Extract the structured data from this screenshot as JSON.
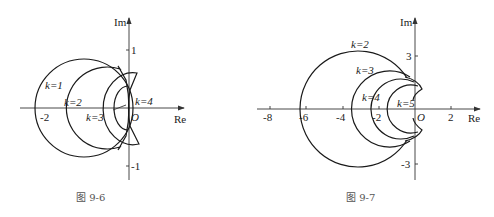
{
  "figures": [
    {
      "caption": "图    9-6",
      "axes": {
        "x_label": "Re",
        "y_label": "Im",
        "origin_label": "O",
        "x_ticks": [
          "-2"
        ],
        "y_ticks": [
          "1",
          "-1"
        ]
      },
      "curve_labels": [
        "k=1",
        "k=2",
        "k=3",
        "k=4"
      ]
    },
    {
      "caption": "图    9-7",
      "axes": {
        "x_label": "Re",
        "y_label": "Im",
        "origin_label": "O",
        "x_ticks": [
          "-8",
          "-6",
          "-4",
          "-2",
          "2"
        ],
        "y_ticks": [
          "3",
          "-3"
        ]
      },
      "curve_labels": [
        "k=2",
        "k=3",
        "k=4",
        "k=5"
      ]
    }
  ]
}
